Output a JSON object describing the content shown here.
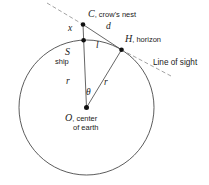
{
  "figure": {
    "points": {
      "crows_nest": {
        "symbol": "C",
        "caption": ", crow's nest"
      },
      "horizon": {
        "symbol": "H",
        "caption": ", horizon"
      },
      "center": {
        "symbol": "O",
        "caption": ", center",
        "caption_line2": "of earth"
      },
      "ship": {
        "symbol": "S",
        "caption": "ship"
      }
    },
    "labels": {
      "mast_height": "x",
      "sight_distance": "d",
      "surface_distance": "l",
      "radius_left": "r",
      "radius_right": "r",
      "central_angle": "θ",
      "line_of_sight": "Line of sight"
    },
    "colors": {
      "circle_stroke": "#4a4a4a",
      "line_stroke": "#555555",
      "dashed_stroke": "#999999",
      "dot_fill": "#111111",
      "text": "#1a1a1a"
    }
  }
}
